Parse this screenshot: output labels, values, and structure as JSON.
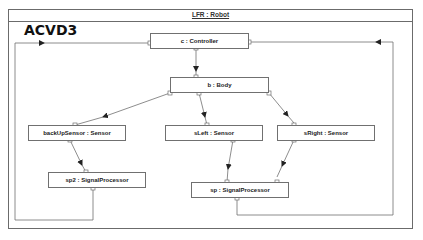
{
  "frame": {
    "title": "LFR : Robot"
  },
  "diagram_label": "ACVD3",
  "parts": [
    {
      "id": "controller",
      "label": "c : Controller"
    },
    {
      "id": "body",
      "label": "b : Body"
    },
    {
      "id": "backup-sensor",
      "label": "backUpSensor : Sensor"
    },
    {
      "id": "sleft",
      "label": "sLeft : Sensor"
    },
    {
      "id": "sright",
      "label": "sRight : Sensor"
    },
    {
      "id": "sp2",
      "label": "sp2 : SignalProcessor"
    },
    {
      "id": "sp",
      "label": "sp : SignalProcessor"
    }
  ],
  "connectors": [
    {
      "from": "c : Controller",
      "to": "b : Body"
    },
    {
      "from": "b : Body",
      "to": "backUpSensor : Sensor"
    },
    {
      "from": "b : Body",
      "to": "sLeft : Sensor"
    },
    {
      "from": "b : Body",
      "to": "sRight : Sensor"
    },
    {
      "from": "backUpSensor : Sensor",
      "to": "sp2 : SignalProcessor"
    },
    {
      "from": "sLeft : Sensor",
      "to": "sp : SignalProcessor"
    },
    {
      "from": "sRight : Sensor",
      "to": "sp : SignalProcessor"
    },
    {
      "from": "sp2 : SignalProcessor",
      "to": "c : Controller"
    },
    {
      "from": "sp : SignalProcessor",
      "to": "c : Controller"
    }
  ]
}
